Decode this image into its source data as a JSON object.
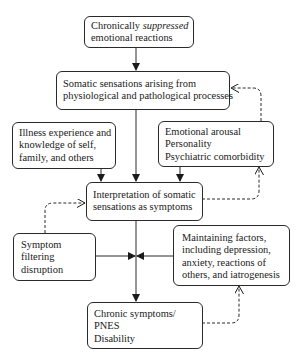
{
  "diagram": {
    "nodes": {
      "suppressed": {
        "line1_pre": "Chronically ",
        "line1_em": "suppressed",
        "line2": "emotional reactions"
      },
      "somatic": {
        "line1": "Somatic sensations arising from",
        "line2": "physiological and pathological processes"
      },
      "illness": {
        "line1": "Illness experience and",
        "line2": "knowledge of self,",
        "line3": "family, and others"
      },
      "emotional": {
        "line1": "Emotional arousal",
        "line2": "Personality",
        "line3": "Psychiatric comorbidity"
      },
      "interpretation": {
        "line1": "Interpretation of somatic",
        "line2": "sensations as symptoms"
      },
      "filtering": {
        "line1": "Symptom",
        "line2": "filtering",
        "line3": "disruption"
      },
      "maintaining": {
        "line1": "Maintaining factors,",
        "line2": "including depression,",
        "line3": "anxiety, reactions of",
        "line4": "others, and iatrogenesis"
      },
      "chronic": {
        "line1": "Chronic symptoms/",
        "line2": "PNES",
        "line3": "Disability"
      }
    },
    "edges": [
      {
        "from": "suppressed",
        "to": "somatic",
        "style": "solid"
      },
      {
        "from": "somatic",
        "to": "interpretation",
        "style": "solid"
      },
      {
        "from": "illness",
        "to": "interpretation",
        "style": "solid"
      },
      {
        "from": "emotional",
        "to": "interpretation",
        "style": "solid"
      },
      {
        "from": "emotional",
        "to": "somatic",
        "style": "dashed"
      },
      {
        "from": "interpretation",
        "to": "emotional",
        "style": "dashed"
      },
      {
        "from": "filtering",
        "to": "interpretation",
        "style": "dashed"
      },
      {
        "from": "interpretation",
        "to": "chronic",
        "style": "solid"
      },
      {
        "from": "filtering",
        "to": "junction",
        "style": "solid"
      },
      {
        "from": "maintaining",
        "to": "junction",
        "style": "solid"
      },
      {
        "from": "chronic",
        "to": "maintaining",
        "style": "dashed"
      }
    ],
    "colors": {
      "stroke": "#2a2a2a",
      "background": "#ffffff"
    }
  }
}
